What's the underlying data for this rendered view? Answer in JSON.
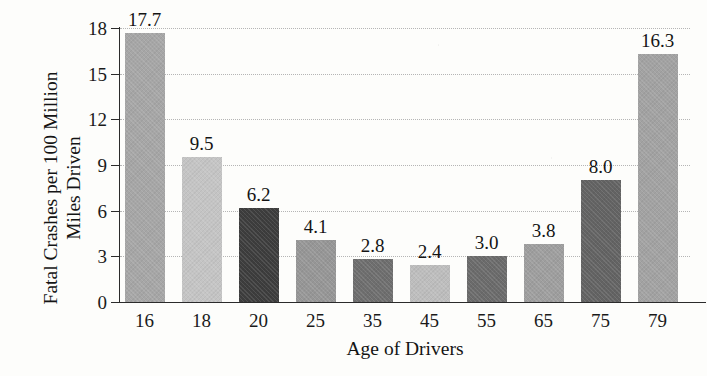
{
  "figure": {
    "cut_off_title_remnant": "",
    "background_color": "#fdfdfb",
    "axis_color": "#2b2b2b",
    "gridline_color": "#b5b5b5"
  },
  "chart_data": {
    "type": "bar",
    "title": "",
    "xlabel": "Age of Drivers",
    "ylabel": "Fatal Crashes per 100 Million Miles Driven",
    "ylabel_line1": "Fatal Crashes per 100 Million",
    "ylabel_line2": "Miles Driven",
    "categories": [
      "16",
      "18",
      "20",
      "25",
      "35",
      "45",
      "55",
      "65",
      "75",
      "79"
    ],
    "values": [
      17.7,
      9.5,
      6.2,
      4.1,
      2.8,
      2.4,
      3.0,
      3.8,
      8.0,
      16.3
    ],
    "value_labels": [
      "17.7",
      "9.5",
      "6.2",
      "4.1",
      "2.8",
      "2.4",
      "3.0",
      "3.8",
      "8.0",
      "16.3"
    ],
    "bar_colors": [
      "#a6a6a6",
      "#c4c4c4",
      "#3d3d3d",
      "#969696",
      "#6e6e6e",
      "#bdbdbd",
      "#6b6b6b",
      "#9e9e9e",
      "#636363",
      "#a2a2a2"
    ],
    "ylim": [
      0,
      18
    ],
    "yticks": [
      0,
      3,
      6,
      9,
      12,
      15,
      18
    ],
    "ytick_labels": [
      "0",
      "3",
      "6",
      "9",
      "12",
      "15",
      "18"
    ],
    "grid": true,
    "grid_style": "dotted-horizontal",
    "legend": null
  }
}
